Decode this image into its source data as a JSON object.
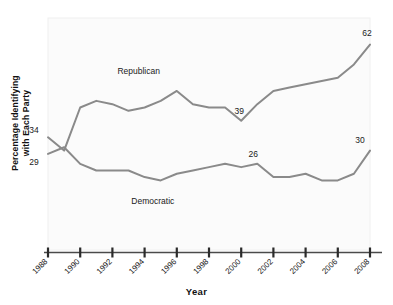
{
  "chart_data": {
    "type": "line",
    "title": "",
    "xlabel": "Year",
    "ylabel": "Percentage Identifying with Each Party",
    "x": [
      1988,
      1989,
      1990,
      1991,
      1992,
      1993,
      1994,
      1995,
      1996,
      1997,
      1998,
      1999,
      2000,
      2001,
      2002,
      2003,
      2004,
      2005,
      2006,
      2007,
      2008
    ],
    "xlim": [
      1988,
      2008
    ],
    "ylim": [
      0,
      70
    ],
    "xticks": [
      "1988",
      "1990",
      "1992",
      "1994",
      "1996",
      "1998",
      "2000",
      "2002",
      "2004",
      "2006",
      "2008"
    ],
    "grid": false,
    "legend": "inline-labels",
    "series": [
      {
        "name": "Republican",
        "color": "#8a8a8a",
        "values": [
          34,
          30,
          43,
          45,
          44,
          42,
          43,
          45,
          48,
          44,
          43,
          43,
          39,
          44,
          48,
          49,
          50,
          51,
          52,
          56,
          62
        ]
      },
      {
        "name": "Democratic",
        "color": "#8a8a8a",
        "values": [
          29,
          31,
          26,
          24,
          24,
          24,
          22,
          21,
          23,
          24,
          25,
          26,
          25,
          26,
          22,
          22,
          23,
          21,
          21,
          23,
          30
        ]
      }
    ],
    "annotations": [
      {
        "text": "34",
        "x": 1988,
        "y": 34,
        "name": "republican-start-value"
      },
      {
        "text": "29",
        "x": 1988,
        "y": 29,
        "name": "democratic-start-value"
      },
      {
        "text": "39",
        "x": 2000,
        "y": 39,
        "name": "republican-trough-value"
      },
      {
        "text": "26",
        "x": 2001,
        "y": 26,
        "name": "democratic-mid-value"
      },
      {
        "text": "62",
        "x": 2008,
        "y": 62,
        "name": "republican-end-value"
      },
      {
        "text": "30",
        "x": 2008,
        "y": 30,
        "name": "democratic-end-value"
      },
      {
        "text": "Republican",
        "x": 1995,
        "y": 53,
        "name": "republican-series-label"
      },
      {
        "text": "Democratic",
        "x": 1996,
        "y": 14,
        "name": "democratic-series-label"
      }
    ]
  },
  "axis": {
    "x_title": "Year",
    "y_title_line1": "Percentage Identifying",
    "y_title_line2": "with Each Party"
  }
}
